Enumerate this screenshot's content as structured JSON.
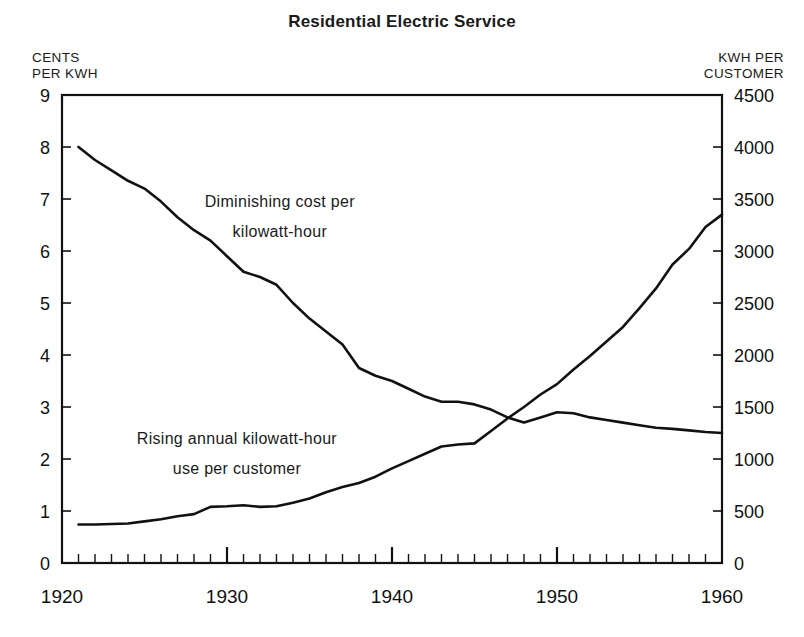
{
  "chart_data": {
    "type": "line",
    "title": "Residential Electric Service",
    "xlabel": "",
    "ylabel": "CENTS\nPER KWH",
    "y2label": "KWH PER\nCUSTOMER",
    "grid": false,
    "legend": "none",
    "xlim": [
      1920,
      1960
    ],
    "ylim": [
      0,
      9
    ],
    "y2lim": [
      0,
      4500
    ],
    "x_major_ticks": [
      1920,
      1930,
      1940,
      1950,
      1960
    ],
    "x_major_tick_labels": [
      "1920",
      "1930",
      "1940",
      "1950",
      "1960"
    ],
    "x_minor_tick_step": 1,
    "y_ticks": [
      0,
      1,
      2,
      3,
      4,
      5,
      6,
      7,
      8,
      9
    ],
    "y_tick_labels": [
      "0",
      "1",
      "2",
      "3",
      "4",
      "5",
      "6",
      "7",
      "8",
      "9"
    ],
    "y2_ticks": [
      0,
      500,
      1000,
      1500,
      2000,
      2500,
      3000,
      3500,
      4000,
      4500
    ],
    "y2_tick_labels": [
      "0",
      "500",
      "1000",
      "1500",
      "2000",
      "2500",
      "3000",
      "3500",
      "4000",
      "4500"
    ],
    "annotations": [
      {
        "text_lines": [
          "Diminishing  cost  per",
          "kilowatt-hour"
        ],
        "x": 1933.2,
        "y_cents": 6.85
      },
      {
        "text_lines": [
          "Rising  annual  kilowatt-hour",
          "use  per  customer"
        ],
        "x": 1930.6,
        "y_cents": 2.28
      }
    ],
    "series": [
      {
        "name": "Diminishing cost per kilowatt-hour",
        "axis": "left",
        "units": "cents per kwh",
        "x": [
          1921,
          1922,
          1923,
          1924,
          1925,
          1926,
          1927,
          1928,
          1929,
          1930,
          1931,
          1932,
          1933,
          1934,
          1935,
          1936,
          1937,
          1938,
          1939,
          1940,
          1941,
          1942,
          1943,
          1944,
          1945,
          1946,
          1947,
          1948,
          1949,
          1950,
          1951,
          1952,
          1953,
          1954,
          1955,
          1956,
          1957,
          1958,
          1959,
          1960
        ],
        "values": [
          8.0,
          7.75,
          7.55,
          7.35,
          7.2,
          6.95,
          6.65,
          6.4,
          6.2,
          5.9,
          5.6,
          5.5,
          5.35,
          5.0,
          4.7,
          4.45,
          4.2,
          3.75,
          3.6,
          3.5,
          3.35,
          3.2,
          3.1,
          3.1,
          3.05,
          2.95,
          2.8,
          2.7,
          2.8,
          2.9,
          2.88,
          2.8,
          2.75,
          2.7,
          2.65,
          2.6,
          2.58,
          2.55,
          2.52,
          2.5
        ]
      },
      {
        "name": "Rising annual kilowatt-hour use per customer",
        "axis": "right",
        "units": "kwh per customer",
        "x": [
          1921,
          1922,
          1923,
          1924,
          1925,
          1926,
          1927,
          1928,
          1929,
          1930,
          1931,
          1932,
          1933,
          1934,
          1935,
          1936,
          1937,
          1938,
          1939,
          1940,
          1941,
          1942,
          1943,
          1944,
          1945,
          1946,
          1947,
          1948,
          1949,
          1950,
          1951,
          1952,
          1953,
          1954,
          1955,
          1956,
          1957,
          1958,
          1959,
          1960
        ],
        "values": [
          370,
          370,
          375,
          380,
          400,
          420,
          450,
          470,
          540,
          545,
          555,
          540,
          545,
          580,
          620,
          680,
          730,
          770,
          830,
          910,
          980,
          1050,
          1120,
          1140,
          1150,
          1270,
          1390,
          1500,
          1620,
          1720,
          1860,
          1990,
          2130,
          2270,
          2450,
          2640,
          2870,
          3020,
          3230,
          3350
        ]
      }
    ]
  },
  "axis_headers": {
    "left": "CENTS\nPER KWH",
    "right": "KWH PER\nCUSTOMER"
  }
}
